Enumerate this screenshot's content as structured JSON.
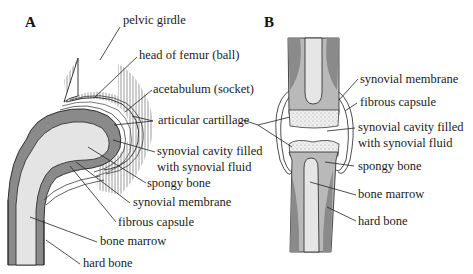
{
  "figure": {
    "panel_a": {
      "letter": "A",
      "title_hint": "hip joint (ball and socket)",
      "labels": {
        "pelvic_girdle": "pelvic girdle",
        "head_of_femur": "head of femur (ball)",
        "acetabulum": "acetabulum (socket)",
        "articular_cartilage": "articular cartillage",
        "synovial_cavity_1": "synovial cavity filled",
        "synovial_cavity_2": "with synovial fluid",
        "spongy_bone": "spongy bone",
        "synovial_membrane": "synovial membrane",
        "fibrous_capsule": "fibrous capsule",
        "bone_marrow": "bone marrow",
        "hard_bone": "hard bone"
      }
    },
    "panel_b": {
      "letter": "B",
      "labels": {
        "synovial_membrane": "synovial membrane",
        "fibrous_capsule": "fibrous capsule",
        "synovial_cavity_1": "synovial cavity filled",
        "synovial_cavity_2": "with synovial fluid",
        "spongy_bone": "spongy bone",
        "bone_marrow": "bone marrow",
        "hard_bone": "hard bone"
      }
    },
    "colors": {
      "hard_bone": "#8a8a8a",
      "spongy_bone": "#b9b9b9",
      "marrow": "#e6e6e6",
      "cartilage": "#ececec",
      "line": "#222222"
    }
  }
}
